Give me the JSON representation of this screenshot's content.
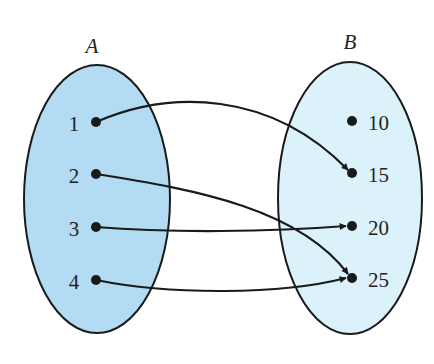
{
  "diagram": {
    "type": "mapping",
    "sets": [
      {
        "name": "A",
        "elements": [
          "1",
          "2",
          "3",
          "4"
        ],
        "fill": "#b3dcf4"
      },
      {
        "name": "B",
        "elements": [
          "10",
          "15",
          "20",
          "25"
        ],
        "fill": "#dcf2fb"
      }
    ],
    "mapping": [
      {
        "from": "1",
        "to": "15"
      },
      {
        "from": "2",
        "to": "25"
      },
      {
        "from": "3",
        "to": "20"
      },
      {
        "from": "4",
        "to": "25"
      }
    ],
    "stroke_color": "#1a1a1a"
  },
  "labels": {
    "setA": "A",
    "setB": "B",
    "a1": "1",
    "a2": "2",
    "a3": "3",
    "a4": "4",
    "b1": "10",
    "b2": "15",
    "b3": "20",
    "b4": "25"
  }
}
